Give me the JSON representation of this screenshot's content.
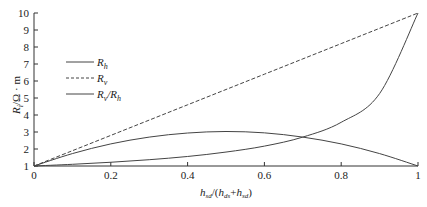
{
  "chart_data": {
    "type": "line",
    "title": "",
    "xlabel": "h_sd/(h_ds+h_sd)",
    "ylabel": "R_i/Ω · m",
    "xlim": [
      0,
      1
    ],
    "ylim": [
      1,
      10
    ],
    "xticks": [
      "0",
      "0.2",
      "0.4",
      "0.6",
      "0.8",
      "1"
    ],
    "yticks": [
      "1",
      "2",
      "3",
      "4",
      "5",
      "6",
      "7",
      "8",
      "9",
      "10"
    ],
    "grid": false,
    "legend_position": "upper-left",
    "x": [
      0,
      0.1,
      0.2,
      0.3,
      0.4,
      0.5,
      0.6,
      0.7,
      0.8,
      0.9,
      1.0
    ],
    "series": [
      {
        "name": "R_h",
        "style": "solid",
        "values": [
          1.0,
          1.1,
          1.22,
          1.37,
          1.56,
          1.82,
          2.17,
          2.7,
          3.57,
          5.26,
          10.0
        ]
      },
      {
        "name": "R_v",
        "style": "dashed",
        "values": [
          1.0,
          1.9,
          2.8,
          3.7,
          4.6,
          5.5,
          6.4,
          7.3,
          8.2,
          9.1,
          10.0
        ]
      },
      {
        "name": "R_v/R_h",
        "style": "solid",
        "values": [
          1.0,
          1.73,
          2.3,
          2.7,
          2.94,
          3.03,
          2.95,
          2.7,
          2.3,
          1.73,
          1.0
        ]
      }
    ]
  },
  "legend": {
    "items": [
      {
        "main": "R",
        "sub": "h",
        "tail": "",
        "tail_sub": ""
      },
      {
        "main": "R",
        "sub": "v",
        "tail": "",
        "tail_sub": ""
      },
      {
        "main": "R",
        "sub": "v",
        "tail": "/R",
        "tail_sub": "h"
      }
    ]
  },
  "axes": {
    "ylabel_main": "R",
    "ylabel_sub": "i",
    "ylabel_rest": "/Ω · m",
    "xlabel_h1": "h",
    "xlabel_s1": "sd",
    "xlabel_mid": "/(",
    "xlabel_h2": "h",
    "xlabel_s2": "ds",
    "xlabel_plus": "+",
    "xlabel_h3": "h",
    "xlabel_s3": "sd",
    "xlabel_end": ")"
  }
}
